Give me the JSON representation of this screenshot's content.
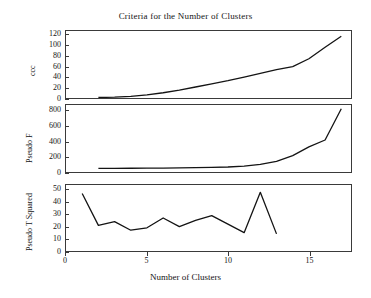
{
  "chart_data": [
    {
      "type": "line",
      "title": "Criteria for the Number of Clusters",
      "panel_id": "ccc",
      "ylabel": "ccc",
      "xlabel": "Number of Clusters",
      "xlim": [
        0,
        17.6
      ],
      "ylim": [
        0,
        128
      ],
      "yticks": [
        0,
        20,
        40,
        60,
        80,
        100,
        120
      ],
      "xticks": [
        0,
        5,
        10,
        15
      ],
      "grid": false,
      "legend": "none",
      "x": [
        2,
        3,
        4,
        5,
        6,
        7,
        8,
        9,
        10,
        11,
        12,
        13,
        14,
        15,
        16,
        17
      ],
      "values": [
        1,
        1.5,
        3,
        6,
        10,
        15,
        21,
        27,
        33,
        40,
        47,
        54,
        60,
        75,
        97,
        118
      ]
    },
    {
      "type": "line",
      "panel_id": "pseudof",
      "ylabel": "Pseudo F",
      "xlabel": "Number of Clusters",
      "xlim": [
        0,
        17.6
      ],
      "ylim": [
        0,
        880
      ],
      "yticks": [
        0,
        200,
        400,
        600,
        800
      ],
      "xticks": [
        0,
        5,
        10,
        15
      ],
      "grid": false,
      "legend": "none",
      "x": [
        2,
        3,
        4,
        5,
        6,
        7,
        8,
        9,
        10,
        11,
        12,
        13,
        14,
        15,
        16,
        17
      ],
      "values": [
        48,
        48,
        49,
        50,
        52,
        54,
        57,
        60,
        66,
        78,
        100,
        140,
        215,
        330,
        420,
        830
      ]
    },
    {
      "type": "line",
      "panel_id": "pseudot",
      "ylabel": "Pseudo T Squared",
      "xlabel": "Number of Clusters",
      "xlim": [
        0,
        17.6
      ],
      "ylim": [
        0,
        54
      ],
      "yticks": [
        0,
        10,
        20,
        30,
        40,
        50
      ],
      "xticks": [
        0,
        5,
        10,
        15
      ],
      "grid": false,
      "legend": "none",
      "x": [
        1,
        2,
        3,
        4,
        5,
        6,
        7,
        8,
        9,
        10,
        11,
        12,
        13
      ],
      "values": [
        47,
        21,
        24,
        17,
        19,
        27,
        20,
        25,
        29,
        22,
        15,
        48,
        14
      ]
    }
  ],
  "figure": {
    "title": "Criteria for the Number of Clusters",
    "xlabel": "Number of Clusters",
    "xticks": [
      "0",
      "5",
      "10",
      "15"
    ],
    "panels": {
      "ccc": {
        "ylabel": "ccc",
        "yticks": [
          "0",
          "20",
          "40",
          "60",
          "80",
          "100",
          "120"
        ]
      },
      "pseudof": {
        "ylabel": "Pseudo F",
        "yticks": [
          "0",
          "200",
          "400",
          "600",
          "800"
        ]
      },
      "pseudot": {
        "ylabel": "Pseudo T Squared",
        "yticks": [
          "0",
          "10",
          "20",
          "30",
          "40",
          "50"
        ]
      }
    },
    "colors": {
      "line": "#141414",
      "frame": "#3a3a3a",
      "background": "#ffffff"
    }
  }
}
